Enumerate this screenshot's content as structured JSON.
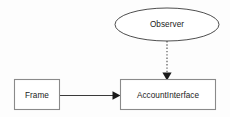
{
  "diagram": {
    "type": "uml-class-diagram",
    "background_color": "#fdfdfd",
    "nodes": [
      {
        "id": "observer",
        "label": "Observer",
        "shape": "ellipse",
        "cx": 167,
        "cy": 24.5,
        "rx": 52,
        "ry": 16.5,
        "fill": "#ffffff",
        "stroke": "#3a3a3a"
      },
      {
        "id": "frame",
        "label": "Frame",
        "shape": "rectangle",
        "x": 14,
        "y": 79,
        "width": 46,
        "height": 31,
        "fill": "#ffffff",
        "stroke": "#8a8a8a"
      },
      {
        "id": "account_interface",
        "label": "AccountInterface",
        "shape": "rectangle",
        "x": 120,
        "y": 79,
        "width": 96,
        "height": 31,
        "fill": "#ffffff",
        "stroke": "#8a8a8a"
      }
    ],
    "edges": [
      {
        "id": "observer-to-accountinterface",
        "from": "observer",
        "to": "account_interface",
        "style": "dotted",
        "arrow": "filled-triangle",
        "label": "",
        "stroke": "#4a4a4a"
      },
      {
        "id": "frame-to-accountinterface",
        "from": "frame",
        "to": "account_interface",
        "style": "solid",
        "arrow": "filled-triangle",
        "label": "",
        "stroke": "#3a3a3a"
      }
    ]
  }
}
